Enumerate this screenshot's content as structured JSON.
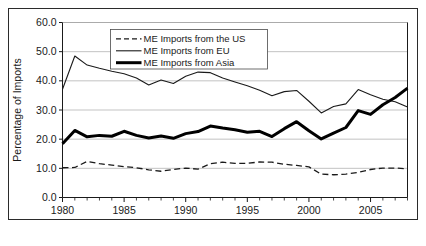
{
  "chart_data": {
    "type": "line",
    "title": "",
    "xlabel": "",
    "ylabel": "Percentage of Imports",
    "xlim": [
      1980,
      2008
    ],
    "ylim": [
      0,
      60
    ],
    "ytick_labels": [
      "0.0",
      "10.0",
      "20.0",
      "30.0",
      "40.0",
      "50.0",
      "60.0"
    ],
    "ytick_values": [
      0,
      10,
      20,
      30,
      40,
      50,
      60
    ],
    "xtick_labels": [
      "1980",
      "1985",
      "1990",
      "1995",
      "2000",
      "2005"
    ],
    "xtick_values": [
      1980,
      1985,
      1990,
      1995,
      2000,
      2005
    ],
    "minor_xticks_every": 1,
    "grid": "horizontal",
    "legend_position": "top-center",
    "x": [
      1980,
      1981,
      1982,
      1983,
      1984,
      1985,
      1986,
      1987,
      1988,
      1989,
      1990,
      1991,
      1992,
      1993,
      1994,
      1995,
      1996,
      1997,
      1998,
      1999,
      2000,
      2001,
      2002,
      2003,
      2004,
      2005,
      2006,
      2007,
      2008
    ],
    "series": [
      {
        "name": "ME Imports from the US",
        "style": "dashed",
        "width": 1.3,
        "color": "#1a1a1a",
        "values": [
          10.2,
          10.3,
          12.4,
          11.6,
          11.1,
          10.6,
          10.2,
          9.5,
          9.0,
          9.6,
          10.1,
          9.7,
          11.6,
          12.1,
          11.7,
          11.7,
          12.2,
          12.1,
          11.4,
          11.0,
          10.5,
          8.0,
          7.8,
          8.0,
          8.6,
          9.6,
          10.1,
          10.1,
          9.8
        ]
      },
      {
        "name": "ME Imports from EU",
        "style": "solid",
        "width": 1.1,
        "color": "#1a1a1a",
        "values": [
          37.1,
          48.5,
          45.4,
          44.3,
          43.3,
          42.4,
          41.0,
          38.6,
          40.3,
          39.1,
          41.6,
          43.0,
          42.8,
          41.0,
          39.6,
          38.3,
          36.8,
          34.9,
          36.3,
          36.7,
          33.0,
          29.0,
          31.2,
          32.1,
          37.0,
          35.2,
          33.7,
          32.8,
          31.0
        ]
      },
      {
        "name": "ME Imports from Asia",
        "style": "solid",
        "width": 3.0,
        "color": "#000000",
        "values": [
          18.4,
          23.0,
          20.8,
          21.3,
          21.0,
          22.7,
          21.3,
          20.4,
          21.1,
          20.3,
          21.9,
          22.6,
          24.5,
          23.8,
          23.2,
          22.4,
          22.7,
          20.9,
          23.6,
          26.0,
          22.9,
          20.1,
          22.1,
          24.0,
          29.8,
          28.5,
          31.8,
          34.3,
          37.5
        ]
      }
    ]
  },
  "legend": {
    "items": [
      {
        "label": "ME Imports from the US"
      },
      {
        "label": "ME Imports from EU"
      },
      {
        "label": "ME Imports from Asia"
      }
    ]
  }
}
